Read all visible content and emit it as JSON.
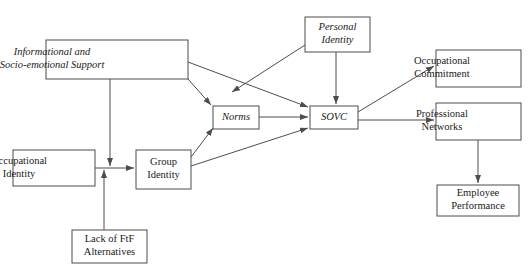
{
  "figure": {
    "type": "conceptual-model-diagram",
    "domain": "path model of sense of virtual community (SOVC)",
    "background_color": "#ffffff",
    "line_color": "#4d4d4d",
    "text_color": "#1a1a1a"
  },
  "nodes": [
    {
      "id": "informational-support",
      "lines": [
        "Informational and",
        "Socio-emotional Support"
      ],
      "italic": true,
      "align": "left",
      "x": 46,
      "y": 40,
      "w": 142,
      "h": 39
    },
    {
      "id": "personal-identity",
      "lines": [
        "Personal",
        "Identity"
      ],
      "italic": true,
      "align": "center",
      "x": 305,
      "y": 17,
      "w": 65,
      "h": 35
    },
    {
      "id": "norms",
      "lines": [
        "Norms"
      ],
      "italic": true,
      "align": "center",
      "x": 213,
      "y": 106,
      "w": 46,
      "h": 23
    },
    {
      "id": "sovc",
      "lines": [
        "SOVC"
      ],
      "italic": true,
      "align": "center",
      "x": 310,
      "y": 106,
      "w": 48,
      "h": 23
    },
    {
      "id": "occupational-identity",
      "lines": [
        "Occupational",
        "Identity"
      ],
      "italic": false,
      "align": "left",
      "x": 13,
      "y": 150,
      "w": 82,
      "h": 36
    },
    {
      "id": "group-identity",
      "lines": [
        "Group",
        "Identity"
      ],
      "italic": false,
      "align": "center",
      "x": 136,
      "y": 150,
      "w": 55,
      "h": 39
    },
    {
      "id": "lack-of-ftf-alternatives",
      "lines": [
        "Lack of FtF",
        "Alternatives"
      ],
      "italic": false,
      "align": "center",
      "x": 72,
      "y": 230,
      "w": 75,
      "h": 33
    },
    {
      "id": "occupational-commitment",
      "lines": [
        "Occupational",
        "Commitment"
      ],
      "italic": false,
      "align": "left",
      "x": 436,
      "y": 50,
      "w": 85,
      "h": 37
    },
    {
      "id": "professional-networks",
      "lines": [
        "Professional",
        "Networks"
      ],
      "italic": false,
      "align": "left",
      "x": 436,
      "y": 103,
      "w": 85,
      "h": 37
    },
    {
      "id": "employee-performance",
      "lines": [
        "Employee",
        "Performance"
      ],
      "italic": false,
      "align": "center",
      "x": 437,
      "y": 185,
      "w": 82,
      "h": 31
    }
  ],
  "edges": [
    {
      "id": "support-to-norms",
      "from": "informational-support",
      "to": "norms",
      "points": [
        [
          188,
          79
        ],
        [
          211,
          105
        ]
      ]
    },
    {
      "id": "support-to-sovc",
      "from": "informational-support",
      "to": "sovc",
      "points": [
        [
          188,
          62
        ],
        [
          308,
          107
        ]
      ]
    },
    {
      "id": "support-to-group-identity",
      "from": "informational-support",
      "to": "group-identity",
      "points": [
        [
          110,
          79
        ],
        [
          110,
          166
        ]
      ]
    },
    {
      "id": "personal-identity-to-sovc",
      "from": "personal-identity",
      "to": "sovc",
      "points": [
        [
          336,
          52
        ],
        [
          336,
          104
        ]
      ]
    },
    {
      "id": "personal-identity-to-norms",
      "from": "personal-identity",
      "to": "norms-inflow",
      "points": [
        [
          305,
          45
        ],
        [
          232,
          92
        ]
      ]
    },
    {
      "id": "norms-to-sovc",
      "from": "norms",
      "to": "sovc",
      "points": [
        [
          259,
          117
        ],
        [
          308,
          117
        ]
      ]
    },
    {
      "id": "occ-identity-to-group",
      "from": "occupational-identity",
      "to": "group-identity",
      "points": [
        [
          95,
          168
        ],
        [
          134,
          168
        ]
      ]
    },
    {
      "id": "lack-ftf-to-junction",
      "from": "lack-of-ftf-alternatives",
      "to": "occupational-identity-link",
      "points": [
        [
          104,
          230
        ],
        [
          104,
          170
        ]
      ]
    },
    {
      "id": "group-identity-to-norms",
      "from": "group-identity",
      "to": "norms",
      "points": [
        [
          191,
          157
        ],
        [
          213,
          128
        ]
      ]
    },
    {
      "id": "group-identity-to-sovc",
      "from": "group-identity",
      "to": "sovc",
      "points": [
        [
          191,
          166
        ],
        [
          308,
          128
        ]
      ]
    },
    {
      "id": "sovc-to-occ-commitment",
      "from": "sovc",
      "to": "occupational-commitment",
      "points": [
        [
          358,
          112
        ],
        [
          434,
          66
        ]
      ]
    },
    {
      "id": "sovc-to-prof-networks",
      "from": "sovc",
      "to": "professional-networks",
      "points": [
        [
          358,
          120
        ],
        [
          434,
          120
        ]
      ]
    },
    {
      "id": "prof-networks-to-employee",
      "from": "professional-networks",
      "to": "employee-performance",
      "points": [
        [
          478,
          140
        ],
        [
          478,
          183
        ]
      ]
    }
  ]
}
